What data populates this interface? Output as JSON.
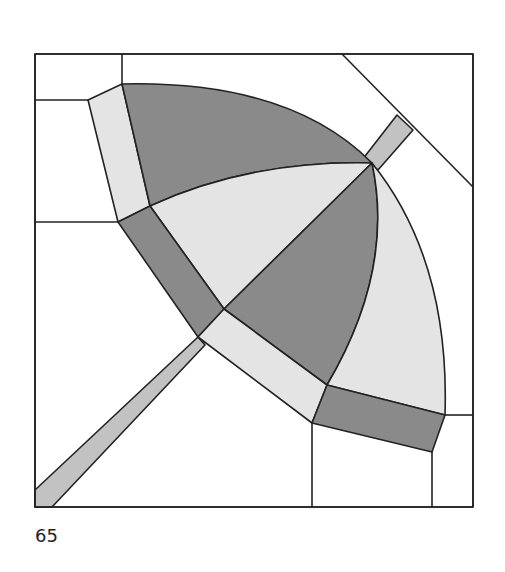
{
  "figure": {
    "number_label": "65",
    "colors": {
      "dark": "#8a8a8a",
      "light": "#e4e4e4",
      "handle": "#c2c2c2",
      "background": "#ffffff",
      "stroke": "#222222"
    }
  }
}
